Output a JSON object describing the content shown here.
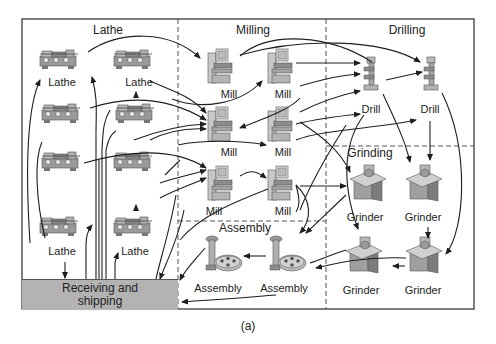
{
  "figure": {
    "caption": "(a)"
  },
  "departments": [
    {
      "id": "lathe",
      "label": "Lathe"
    },
    {
      "id": "milling",
      "label": "Milling"
    },
    {
      "id": "drilling",
      "label": "Drilling"
    },
    {
      "id": "grinding",
      "label": "Grinding"
    },
    {
      "id": "assembly",
      "label": "Assembly"
    }
  ],
  "receiving": {
    "line1": "Receiving and",
    "line2": "shipping"
  },
  "machines": {
    "lathes": [
      {
        "label": "Lathe"
      },
      {
        "label": "Lathe"
      },
      {
        "label": ""
      },
      {
        "label": ""
      },
      {
        "label": ""
      },
      {
        "label": ""
      },
      {
        "label": "Lathe"
      },
      {
        "label": "Lathe"
      }
    ],
    "mills": [
      {
        "label": "Mill"
      },
      {
        "label": "Mill"
      },
      {
        "label": "Mill"
      },
      {
        "label": "Mill"
      },
      {
        "label": "Mill"
      },
      {
        "label": "Mill"
      }
    ],
    "drills": [
      {
        "label": "Drill"
      },
      {
        "label": "Drill"
      }
    ],
    "grinders": [
      {
        "label": "Grinder"
      },
      {
        "label": "Grinder"
      },
      {
        "label": "Grinder"
      },
      {
        "label": "Grinder"
      }
    ],
    "assembly": [
      {
        "label": "Assembly"
      },
      {
        "label": "Assembly"
      }
    ]
  },
  "colors": {
    "frame": "#3a3a3a",
    "receiving_fill": "#b3b3b3",
    "machine_fill": "#a8a8a8",
    "machine_dark": "#6e6e6e",
    "arrow": "#1e1e1e"
  }
}
